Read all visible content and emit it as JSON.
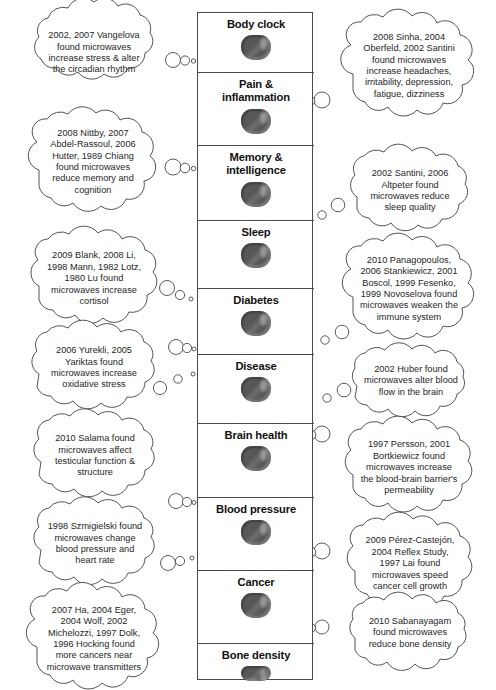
{
  "diagram": {
    "type": "concept-map",
    "stroke_color": "#4a4a4a",
    "icon_color": "#585858",
    "background": "#ffffff"
  },
  "center_column": {
    "topics": [
      {
        "label": "Body clock",
        "icon": "brain-icon"
      },
      {
        "label": "Pain &\ninflammation",
        "icon": "brain-icon"
      },
      {
        "label": "Memory &\nintelligence",
        "icon": "brain-icon"
      },
      {
        "label": "Sleep",
        "icon": "brain-icon"
      },
      {
        "label": "Diabetes",
        "icon": "brain-icon"
      },
      {
        "label": "Disease",
        "icon": "brain-icon"
      },
      {
        "label": "Brain health",
        "icon": "brain-icon"
      },
      {
        "label": "Blood pressure",
        "icon": "brain-icon"
      },
      {
        "label": "Cancer",
        "icon": "brain-icon"
      },
      {
        "label": "Bone density",
        "icon": "brain-icon"
      }
    ]
  },
  "left_clouds": [
    {
      "text": "2002, 2007 Vangelova\nfound microwaves\nincrease stress & alter\nthe circadian rhythm"
    },
    {
      "text": "2008 Nittby, 2007\nAbdel-Rassoul, 2006\nHutter, 1989 Chiang\nfound microwaves\nreduce memory and\ncognition"
    },
    {
      "text": "2009 Blank, 2008 Li,\n1998 Mann, 1982 Lotz,\n1980 Lu found\nmicrowaves increase\ncortisol"
    },
    {
      "text": "2006 Yurekli, 2005\nYariktas found\nmicrowaves increase\noxidative stress"
    },
    {
      "text": "2010 Salama found\nmicrowaves affect\ntesticular function &\nstructure"
    },
    {
      "text": "1998 Szmigielski found\nmicrowaves change\nblood pressure and\nheart rate"
    },
    {
      "text": "2007 Ha, 2004 Eger,\n2004 Wolf, 2002\nMichelozzi, 1997 Dolk,\n1996 Hocking found\nmore cancers near\nmicrowave transmitters"
    }
  ],
  "right_clouds": [
    {
      "text": "2008 Sinha, 2004\nOberfeld, 2002 Santini\nfound microwaves\nincrease headaches,\nirritability, depression,\nfatigue, dizziness"
    },
    {
      "text": "2002 Santini, 2006\nAltpeter found\nmicrowaves reduce\nsleep quality"
    },
    {
      "text": "2010 Panagopoulos,\n2006 Stankiewicz, 2001\nBoscol, 1999 Fesenko,\n1999 Novoselova found\nmicrowaves weaken the\nimmune system"
    },
    {
      "text": "2002 Huber found\nmicrowaves alter blood\nflow in the brain"
    },
    {
      "text": "1997 Persson, 2001\nBortkiewicz found\nmicrowaves increase\nthe blood-brain barrier's\npermeability"
    },
    {
      "text": "2009 Pérez-Castejón,\n2004 Reflex Study,\n1997 Lai found\nmicrowaves speed\ncancer cell growth"
    },
    {
      "text": "2010 Sabanayagam\nfound microwaves\nreduce bone density"
    }
  ],
  "connectors": {
    "style": "thought-bubble-trail",
    "bubble_counts": [
      3,
      3,
      3
    ]
  }
}
